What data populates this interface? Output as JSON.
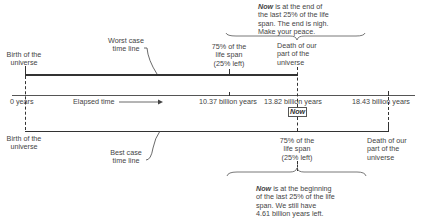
{
  "diagram": {
    "axis": {
      "ticks": [
        {
          "value": "0 years",
          "x": 25
        },
        {
          "value": "10.37 billion years",
          "x": 229
        },
        {
          "value": "13.82 billion years",
          "x": 297
        },
        {
          "value": "18.43 billion years",
          "x": 388
        }
      ],
      "elapsed_label": "Elapsed time",
      "now_label": "Now"
    },
    "worst_case": {
      "timeline_label_1": "Worst case",
      "timeline_label_2": "time line",
      "birth_1": "Birth of the",
      "birth_2": "universe",
      "pct_1": "75% of the",
      "pct_2": "life span",
      "pct_3": "(25% left)",
      "death_1": "Death of our",
      "death_2": "part of the",
      "death_3": "universe",
      "note_now": "Now",
      "note_1": " is at the end of",
      "note_2": "the last 25% of the life",
      "note_3": "span. The end is nigh.",
      "note_4": "Make your peace."
    },
    "best_case": {
      "timeline_label_1": "Best case",
      "timeline_label_2": "time line",
      "birth_1": "Birth of the",
      "birth_2": "universe",
      "pct_1": "75% of the",
      "pct_2": "life span",
      "pct_3": "(25% left)",
      "death_1": "Death of our",
      "death_2": "part of the",
      "death_3": "universe",
      "note_now": "Now",
      "note_1": " is at the beginning",
      "note_2": "of the last 25% of the life",
      "note_3": "span. We still have",
      "note_4": "4.61 billion years left."
    }
  }
}
